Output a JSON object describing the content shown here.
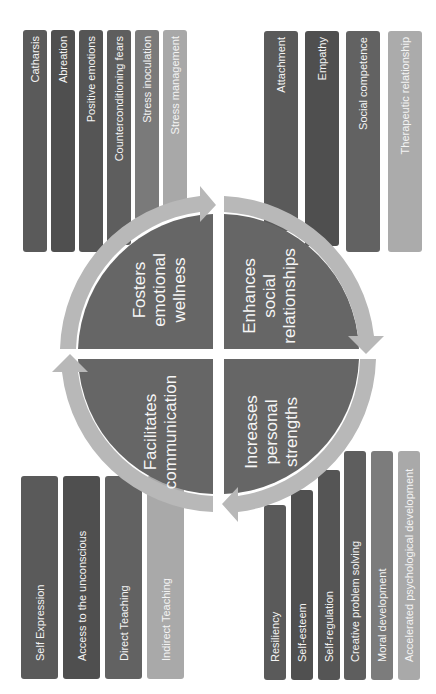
{
  "colors": {
    "quadrant_fill": "#666666",
    "ring": "#b8b8b8",
    "bar_dark": "#595959",
    "bar_darker": "#4f4f4f",
    "bar_mid": "#6e6e6e",
    "bar_light": "#a6a6a6",
    "bar_lighter": "#b5b5b5",
    "label_text": "#f4f4f4"
  },
  "quadrants": {
    "top_left": {
      "label": [
        "Fosters",
        "emotional",
        "wellness"
      ]
    },
    "top_right": {
      "label": [
        "Enhances",
        "social",
        "relationships"
      ]
    },
    "bottom_left": {
      "label": [
        "Facilitates",
        "communication"
      ]
    },
    "bottom_right": {
      "label": [
        "Increases",
        "personal",
        "strengths"
      ]
    }
  },
  "groups": {
    "emotional_wellness": {
      "items": [
        "Catharsis",
        "Abreation",
        "Positive emotions",
        "Counterconditioning fears",
        "Stress inoculation",
        "Stress management"
      ]
    },
    "social_relationships": {
      "items": [
        "Attachment",
        "Empathy",
        "Social competence",
        "Therapeutic relationship"
      ]
    },
    "communication": {
      "items": [
        "Self Expression",
        "Access to the unconscious",
        "Direct Teaching",
        "Indirect Teaching"
      ]
    },
    "personal_strengths": {
      "items": [
        "Resiliency",
        "Self-esteem",
        "Self-regulation",
        "Creative problem solving",
        "Moral development",
        "Accelerated psychological development"
      ]
    }
  }
}
